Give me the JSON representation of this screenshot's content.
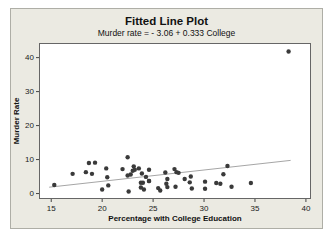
{
  "figure": {
    "panel_bg": "#ebeae2",
    "plot_bg": "#ffffff"
  },
  "chart_data": {
    "type": "scatter",
    "title": "Fitted Line Plot",
    "subtitle": "Murder rate =  - 3.06 + 0.333 College",
    "xlabel": "Percentage with College Education",
    "ylabel": "Murder Rate",
    "x_ticks": [
      15,
      20,
      25,
      30,
      35,
      40
    ],
    "y_ticks": [
      0,
      10,
      20,
      30,
      40
    ],
    "xlim": [
      13.8,
      40.5
    ],
    "ylim": [
      -1.6,
      44.3
    ],
    "grid": false,
    "legend": false,
    "point_color": "#3a3a3a",
    "line_color": "#a6a6a6",
    "fit_line": {
      "intercept": -3.06,
      "slope": 0.333,
      "x_start": 14.8,
      "x_end": 38.5
    },
    "points": [
      [
        15.3,
        2.5
      ],
      [
        17.1,
        5.8
      ],
      [
        18.4,
        6.3
      ],
      [
        18.7,
        9.0
      ],
      [
        19.0,
        5.8
      ],
      [
        19.3,
        9.1
      ],
      [
        20.0,
        1.2
      ],
      [
        20.4,
        7.4
      ],
      [
        20.5,
        4.8
      ],
      [
        20.6,
        2.4
      ],
      [
        22.0,
        7.2
      ],
      [
        22.5,
        10.7
      ],
      [
        22.5,
        5.3
      ],
      [
        22.6,
        0.6
      ],
      [
        22.8,
        5.6
      ],
      [
        23.0,
        6.7
      ],
      [
        23.1,
        8.0
      ],
      [
        23.2,
        7.0
      ],
      [
        23.6,
        7.4
      ],
      [
        23.8,
        1.8
      ],
      [
        23.8,
        3.2
      ],
      [
        23.9,
        5.9
      ],
      [
        24.0,
        3.2
      ],
      [
        24.1,
        1.2
      ],
      [
        24.3,
        4.9
      ],
      [
        24.6,
        7.0
      ],
      [
        24.6,
        3.7
      ],
      [
        24.6,
        3.7
      ],
      [
        25.5,
        1.6
      ],
      [
        25.7,
        0.9
      ],
      [
        26.2,
        6.2
      ],
      [
        26.3,
        2.9
      ],
      [
        26.4,
        4.3
      ],
      [
        26.4,
        1.9
      ],
      [
        27.1,
        7.2
      ],
      [
        27.2,
        2.0
      ],
      [
        27.3,
        6.3
      ],
      [
        27.5,
        6.1
      ],
      [
        28.1,
        4.3
      ],
      [
        28.6,
        3.3
      ],
      [
        28.7,
        5.0
      ],
      [
        28.8,
        1.5
      ],
      [
        30.1,
        1.4
      ],
      [
        30.1,
        3.5
      ],
      [
        31.2,
        3.1
      ],
      [
        31.6,
        2.9
      ],
      [
        31.9,
        5.7
      ],
      [
        32.3,
        8.1
      ],
      [
        32.7,
        2.0
      ],
      [
        34.6,
        3.1
      ],
      [
        38.3,
        41.8
      ]
    ]
  }
}
